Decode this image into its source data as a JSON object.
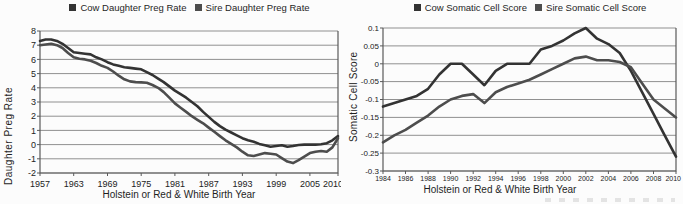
{
  "chart_data": [
    {
      "type": "line",
      "title": "",
      "xlabel": "Holstein or Red & White Birth Year",
      "ylabel": "Daughter Preg Rate",
      "xlim": [
        1957,
        2010
      ],
      "ylim": [
        -2,
        8
      ],
      "grid": true,
      "legend_position": "top",
      "x_ticks": [
        1957,
        1963,
        1969,
        1975,
        1981,
        1987,
        1993,
        1999,
        2005,
        2010
      ],
      "y_ticks": [
        8,
        7,
        6,
        5,
        4,
        3,
        2,
        1,
        0,
        -1,
        -2
      ],
      "y_tick_labels": [
        "8",
        "7",
        "6",
        "5",
        "4",
        "3",
        "2",
        "1",
        "0",
        "-1",
        "-2"
      ],
      "x": [
        1957,
        1958,
        1959,
        1960,
        1961,
        1962,
        1963,
        1964,
        1965,
        1966,
        1967,
        1968,
        1969,
        1970,
        1971,
        1972,
        1973,
        1974,
        1975,
        1976,
        1977,
        1978,
        1979,
        1980,
        1981,
        1982,
        1983,
        1984,
        1985,
        1986,
        1987,
        1988,
        1989,
        1990,
        1991,
        1992,
        1993,
        1994,
        1995,
        1996,
        1997,
        1998,
        1999,
        2000,
        2001,
        2002,
        2003,
        2004,
        2005,
        2006,
        2007,
        2008,
        2009,
        2010
      ],
      "series": [
        {
          "name": "Cow Daughter Preg Rate",
          "color": "#333333",
          "values": [
            7.3,
            7.4,
            7.4,
            7.3,
            7.1,
            6.8,
            6.5,
            6.45,
            6.4,
            6.35,
            6.15,
            6.0,
            5.8,
            5.65,
            5.55,
            5.45,
            5.4,
            5.35,
            5.3,
            5.1,
            4.9,
            4.65,
            4.4,
            4.1,
            3.8,
            3.55,
            3.3,
            3.0,
            2.7,
            2.3,
            1.95,
            1.6,
            1.3,
            1.05,
            0.85,
            0.65,
            0.45,
            0.3,
            0.2,
            0.05,
            -0.05,
            -0.15,
            -0.1,
            -0.05,
            -0.15,
            -0.1,
            -0.03,
            0,
            0,
            0,
            0.02,
            0.1,
            0.3,
            0.6
          ]
        },
        {
          "name": "Sire Daughter Preg Rate",
          "color": "#4d4d4d",
          "values": [
            7.0,
            7.05,
            7.1,
            7.0,
            6.8,
            6.45,
            6.15,
            6.05,
            6.0,
            5.9,
            5.75,
            5.55,
            5.4,
            5.15,
            4.85,
            4.6,
            4.45,
            4.4,
            4.38,
            4.35,
            4.2,
            4.0,
            3.7,
            3.3,
            2.9,
            2.6,
            2.3,
            2.0,
            1.75,
            1.5,
            1.2,
            0.9,
            0.6,
            0.3,
            0.05,
            -0.2,
            -0.5,
            -0.75,
            -0.8,
            -0.7,
            -0.6,
            -0.65,
            -0.7,
            -0.95,
            -1.2,
            -1.3,
            -1.1,
            -0.85,
            -0.6,
            -0.5,
            -0.45,
            -0.5,
            -0.2,
            0.45
          ]
        }
      ]
    },
    {
      "type": "line",
      "title": "",
      "xlabel": "Holstein or Red & White Birth Year",
      "ylabel": "Somatic Cell Score",
      "xlim": [
        1984,
        2010
      ],
      "ylim": [
        -0.3,
        0.1
      ],
      "grid": true,
      "legend_position": "top",
      "x_ticks": [
        1984,
        1986,
        1988,
        1990,
        1992,
        1994,
        1996,
        1998,
        2000,
        2002,
        2004,
        2006,
        2008,
        2010
      ],
      "y_ticks": [
        0.1,
        0.05,
        0,
        -0.05,
        -0.1,
        -0.15,
        -0.2,
        -0.25,
        -0.3
      ],
      "y_tick_labels": [
        "0.1",
        "0.05",
        "0",
        "-0.05",
        "-0.1",
        "-0.15",
        "-0.2",
        "-0.25",
        "-0.3"
      ],
      "x": [
        1984,
        1985,
        1986,
        1987,
        1988,
        1989,
        1990,
        1991,
        1992,
        1993,
        1994,
        1995,
        1996,
        1997,
        1998,
        1999,
        2000,
        2001,
        2002,
        2003,
        2004,
        2005,
        2006,
        2007,
        2008,
        2009,
        2010
      ],
      "series": [
        {
          "name": "Cow Somatic Cell Score",
          "color": "#333333",
          "values": [
            -0.12,
            -0.11,
            -0.1,
            -0.09,
            -0.07,
            -0.03,
            0,
            0,
            -0.03,
            -0.06,
            -0.02,
            0,
            0,
            0,
            0.04,
            0.05,
            0.065,
            0.085,
            0.1,
            0.07,
            0.055,
            0.03,
            -0.02,
            -0.08,
            -0.14,
            -0.2,
            -0.26
          ]
        },
        {
          "name": "Sire Somatic Cell Score",
          "color": "#4d4d4d",
          "values": [
            -0.22,
            -0.2,
            -0.185,
            -0.165,
            -0.145,
            -0.12,
            -0.1,
            -0.09,
            -0.085,
            -0.11,
            -0.08,
            -0.065,
            -0.055,
            -0.045,
            -0.03,
            -0.015,
            0,
            0.015,
            0.02,
            0.01,
            0.01,
            0.005,
            -0.01,
            -0.055,
            -0.1,
            -0.125,
            -0.15
          ]
        }
      ]
    }
  ]
}
